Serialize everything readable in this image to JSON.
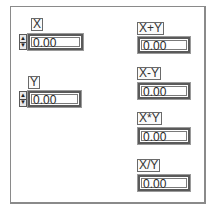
{
  "controls": [
    {
      "label": "X",
      "value": "0.00"
    },
    {
      "label": "Y",
      "value": "0.00"
    }
  ],
  "indicators": [
    {
      "label": "X+Y",
      "value": "0.00"
    },
    {
      "label": "X-Y",
      "value": "0.00"
    },
    {
      "label": "X*Y",
      "value": "0.00"
    },
    {
      "label": "X/Y",
      "value": "0.00"
    }
  ],
  "icons": {
    "increment": "▲",
    "decrement": "▼"
  }
}
